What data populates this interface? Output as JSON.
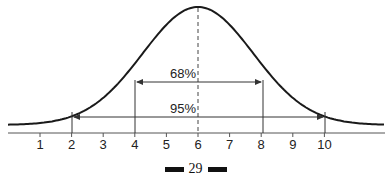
{
  "chart_data": {
    "type": "line",
    "title": "",
    "xlabel": "",
    "ylabel": "",
    "mean": 5.5,
    "sd": 1,
    "x_ticks": [
      "1",
      "2",
      "3",
      "4",
      "5",
      "6",
      "7",
      "8",
      "9",
      "10"
    ],
    "x_range": [
      -0.5,
      11.5
    ],
    "grid": false,
    "annotations": [
      {
        "label": "68%",
        "from": 3.5,
        "to": 7.5
      },
      {
        "label": "95%",
        "from": 1.5,
        "to": 9.5
      }
    ],
    "mean_line": {
      "x": 5.5,
      "style": "dashed"
    }
  },
  "labels": {
    "interval_68": "68%",
    "interval_95": "95%"
  },
  "footer": {
    "page_number": "29"
  },
  "colors": {
    "curve": "#1a1a1a",
    "lines": "#333333",
    "background": "#ffffff"
  }
}
